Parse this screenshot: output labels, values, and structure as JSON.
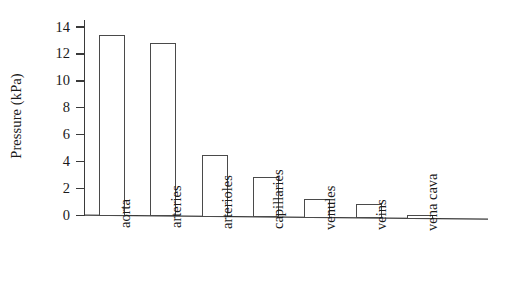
{
  "chart_data": {
    "type": "bar",
    "title": "",
    "subtitle": "",
    "xlabel": "",
    "ylabel": "Pressure (kPa)",
    "categories": [
      "aorta",
      "arteries",
      "arterioles",
      "capillaries",
      "venules",
      "veins",
      "vena cava"
    ],
    "values": [
      13.4,
      12.9,
      4.6,
      3.0,
      1.4,
      1.1,
      0.3
    ],
    "series": [
      {
        "name": "Pressure",
        "values": [
          13.4,
          12.9,
          4.6,
          3.0,
          1.4,
          1.1,
          0.3
        ]
      }
    ],
    "ylim": [
      0,
      14
    ],
    "ytick_labels": [
      "14",
      "12",
      "10",
      "8",
      "6",
      "4",
      "2",
      "0"
    ],
    "ytick_values": [
      14,
      12,
      10,
      8,
      6,
      4,
      2,
      0
    ],
    "ytick_step": 2,
    "grid": false,
    "legend": false,
    "legend_position": "none",
    "bar_fill_color": "#ffffff",
    "bar_edge_color": "#4a4a4a",
    "axis_color": "#3a3a3a",
    "background_color": "#ffffff",
    "annotations": []
  }
}
